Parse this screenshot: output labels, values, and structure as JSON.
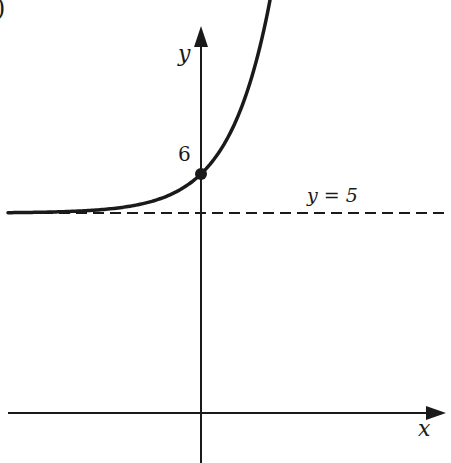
{
  "figure": {
    "corner_fragment": ")",
    "y_axis_label": "y",
    "x_axis_label": "x",
    "point_label": "6",
    "asymptote_label": "y = 5",
    "colors": {
      "ink": "#1a1a1a",
      "background": "#ffffff"
    }
  },
  "chart_data": {
    "type": "line",
    "title": "",
    "xlabel": "x",
    "ylabel": "y",
    "series": [
      {
        "name": "curve",
        "function": "y = 5 + e^(kx)",
        "y_intercept": 6,
        "asymptote": 5
      }
    ],
    "annotations": [
      {
        "type": "point",
        "x": 0,
        "y": 6,
        "label": "6"
      },
      {
        "type": "dashed_line",
        "y": 5,
        "label": "y = 5"
      }
    ],
    "grid": false
  }
}
